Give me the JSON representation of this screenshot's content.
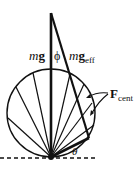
{
  "diagram": {
    "labels": {
      "mg": "m",
      "mg_bold": "g",
      "phi": "ϕ",
      "mg_eff_m": "m",
      "mg_eff_g": "g",
      "mg_eff_sub": "eff",
      "f_cent": "F",
      "f_cent_sub": "cent",
      "theta": "θ"
    },
    "colors": {
      "stroke": "#111111",
      "background": "#ffffff"
    },
    "geometry": {
      "circle": {
        "cx": 51,
        "cy": 113,
        "r": 44
      },
      "apex": {
        "x": 51,
        "y": 157
      },
      "vertical_top": {
        "x": 51,
        "y": 13
      },
      "mg_eff_end": {
        "x": 89,
        "y": 138
      }
    }
  }
}
